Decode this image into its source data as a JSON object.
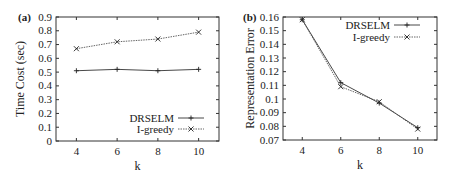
{
  "chart_data": [
    {
      "panel": "(a)",
      "type": "line",
      "title": "",
      "xlabel": "k",
      "ylabel": "Time Cost (sec)",
      "x": [
        4,
        6,
        8,
        10
      ],
      "xticks": [
        "4",
        "6",
        "8",
        "10"
      ],
      "xlim": [
        3,
        11
      ],
      "ylim": [
        0,
        0.9
      ],
      "yticks": [
        "0",
        "0.1",
        "0.2",
        "0.3",
        "0.4",
        "0.5",
        "0.6",
        "0.7",
        "0.8",
        "0.9"
      ],
      "grid": false,
      "legend_position": "lower right",
      "series": [
        {
          "name": "DRSELM",
          "values": [
            0.51,
            0.52,
            0.51,
            0.52
          ],
          "marker": "+",
          "line": "solid"
        },
        {
          "name": "I-greedy",
          "values": [
            0.67,
            0.72,
            0.74,
            0.79
          ],
          "marker": "x",
          "line": "dotted"
        }
      ]
    },
    {
      "panel": "(b)",
      "type": "line",
      "title": "",
      "xlabel": "k",
      "ylabel": "Representation Error",
      "x": [
        4,
        6,
        8,
        10
      ],
      "xticks": [
        "4",
        "6",
        "8",
        "10"
      ],
      "xlim": [
        3,
        11
      ],
      "ylim": [
        0.07,
        0.16
      ],
      "yticks": [
        "0.07",
        "0.08",
        "0.09",
        "0.1",
        "0.11",
        "0.12",
        "0.13",
        "0.14",
        "0.15",
        "0.16"
      ],
      "grid": false,
      "legend_position": "upper right",
      "series": [
        {
          "name": "DRSELM",
          "values": [
            0.158,
            0.112,
            0.097,
            0.079
          ],
          "marker": "+",
          "line": "solid"
        },
        {
          "name": "I-greedy",
          "values": [
            0.158,
            0.109,
            0.098,
            0.078
          ],
          "marker": "x",
          "line": "dotted"
        }
      ]
    }
  ],
  "labels": {
    "a": {
      "panel": "(a)",
      "ylabel": "Time Cost (sec)",
      "xlabel": "k",
      "legend": [
        "DRSELM",
        "I-greedy"
      ]
    },
    "b": {
      "panel": "(b)",
      "ylabel": "Representation Error",
      "xlabel": "k",
      "legend": [
        "DRSELM",
        "I-greedy"
      ]
    }
  }
}
